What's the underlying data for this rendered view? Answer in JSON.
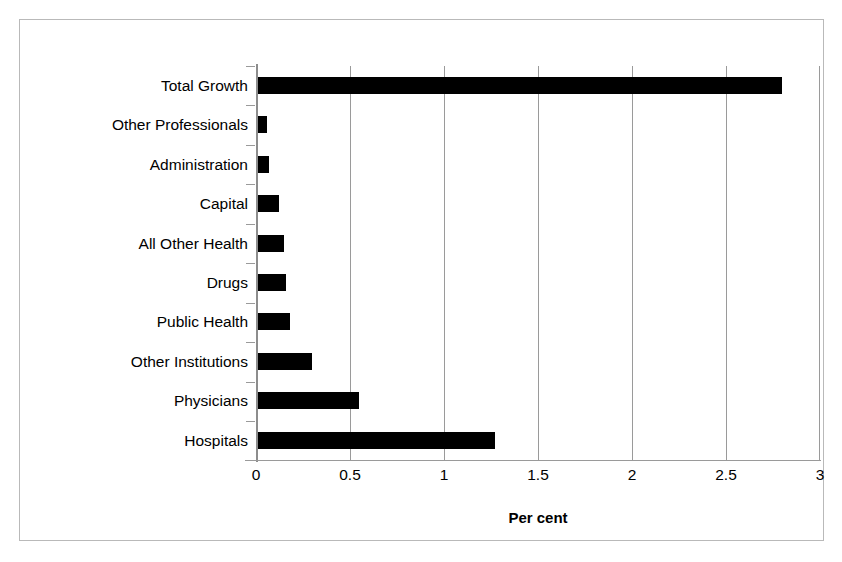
{
  "chart_data": {
    "type": "bar",
    "orientation": "horizontal",
    "title": "",
    "xlabel": "Per cent",
    "ylabel": "",
    "xlim": [
      0,
      3
    ],
    "xticks": [
      "0",
      "0.5",
      "1",
      "1.5",
      "2",
      "2.5",
      "3"
    ],
    "xtick_values": [
      0,
      0.5,
      1,
      1.5,
      2,
      2.5,
      3
    ],
    "grid": "vertical",
    "legend": "none",
    "bar_color": "#000000",
    "categories": [
      "Total Growth",
      "Other Professionals",
      "Administration",
      "Capital",
      "All Other Health",
      "Drugs",
      "Public Health",
      "Other Institutions",
      "Physicians",
      "Hospitals"
    ],
    "values": [
      2.8,
      0.06,
      0.07,
      0.12,
      0.15,
      0.16,
      0.18,
      0.3,
      0.55,
      1.27
    ]
  },
  "axis": {
    "title": "Per cent"
  }
}
